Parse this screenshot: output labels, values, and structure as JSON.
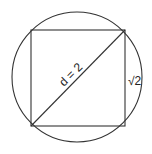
{
  "diagram": {
    "type": "geometry",
    "diagonal_label": "d = 2",
    "side_label": "√2",
    "colors": {
      "stroke": "#333333",
      "background": "#ffffff"
    }
  }
}
